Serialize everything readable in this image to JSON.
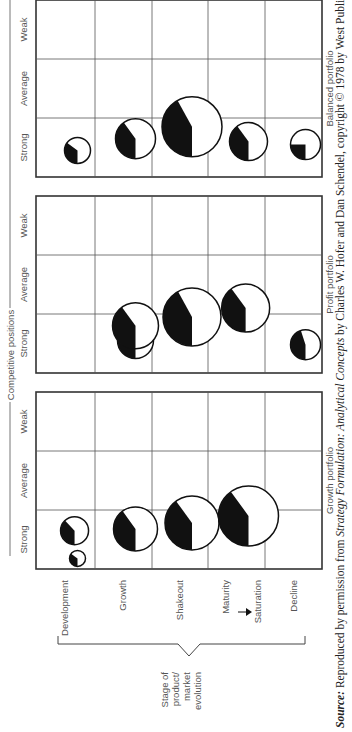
{
  "figure": {
    "header": "Competitive positions",
    "position_labels": [
      "Strong",
      "Average",
      "Weak"
    ],
    "stage_axis_label": [
      "Stage of",
      "product/",
      "market",
      "evolution"
    ],
    "stages": [
      "Development",
      "Growth",
      "Shakeout",
      "Maturity",
      "Saturation",
      "Decline"
    ],
    "stage_rows": [
      "Development",
      "Growth",
      "Shakeout",
      "Maturity → Saturation",
      "Decline"
    ],
    "panels": [
      {
        "title": "Growth portfolio",
        "bubbles": [
          {
            "stage": 0,
            "position": "Strong",
            "dx": 0.18,
            "r": 8,
            "share": 0.35
          },
          {
            "stage": 0,
            "position": "Strong",
            "dx": 0.65,
            "r": 14,
            "share": 0.38,
            "stage_offset": 0.45
          },
          {
            "stage": 1,
            "position": "Strong",
            "dx": 0.68,
            "r": 22,
            "share": 0.4
          },
          {
            "stage": 2,
            "position": "Strong",
            "dx": 0.78,
            "r": 27,
            "share": 0.4
          },
          {
            "stage": 3,
            "position": "Strong",
            "dx": 0.9,
            "r": 30,
            "share": 0.4
          }
        ]
      },
      {
        "title": "Profit portfolio",
        "bubbles": [
          {
            "stage": 1,
            "position": "Strong",
            "dx": 0.55,
            "r": 18,
            "share": 0.38
          },
          {
            "stage": 1,
            "position": "Strong",
            "dx": 0.8,
            "r": 23,
            "share": 0.4,
            "stage_offset": 0.5
          },
          {
            "stage": 2,
            "position": "Strong",
            "dx": 0.95,
            "r": 29,
            "share": 0.42,
            "stage_offset": 0.5
          },
          {
            "stage": 3,
            "position": "Strong",
            "dx": 1.1,
            "r": 24,
            "share": 0.4,
            "stage_offset": 0.45
          },
          {
            "stage": 4,
            "position": "Strong",
            "dx": 0.48,
            "r": 15,
            "share": 0.45
          }
        ]
      },
      {
        "title": "Balanced portfolio",
        "bubbles": [
          {
            "stage": 0,
            "position": "Strong",
            "dx": 0.45,
            "r": 13,
            "share": 0.35
          },
          {
            "stage": 1,
            "position": "Strong",
            "dx": 0.65,
            "r": 20,
            "share": 0.4
          },
          {
            "stage": 2,
            "position": "Strong",
            "dx": 0.85,
            "r": 30,
            "share": 0.42
          },
          {
            "stage": 3,
            "position": "Strong",
            "dx": 0.6,
            "r": 19,
            "share": 0.4
          },
          {
            "stage": 4,
            "position": "Strong",
            "dx": 0.55,
            "r": 15,
            "share": 0.25
          }
        ]
      }
    ],
    "source_line": "Source: Reproduced by permission from Strategy Formulation: Analytical Concepts by Charles W. Hofer and Dan Schendel, copyright © 1978 by West Publishing",
    "source_prefix": "Source:",
    "source_mid1": " Reproduced by permission from ",
    "source_italic": "Strategy Formulation: Analytical Concepts",
    "source_mid2": " by Charles W. Hofer and Dan Schendel, copyright © 1978 by West Publishing"
  }
}
